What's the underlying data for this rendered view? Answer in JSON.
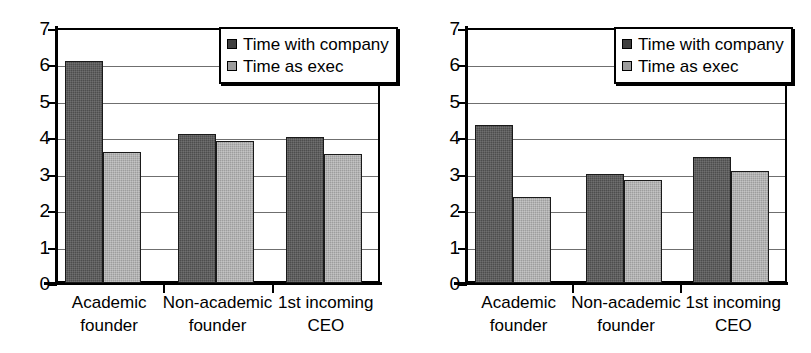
{
  "chart_data": [
    {
      "type": "bar",
      "panel": "left",
      "title": "",
      "xlabel": "",
      "ylabel": "",
      "ylim": [
        0,
        7
      ],
      "yticks": [
        0,
        1,
        2,
        3,
        4,
        5,
        6,
        7
      ],
      "grid": true,
      "legend_position": "top-right",
      "categories": [
        "Academic founder",
        "Non-academic founder",
        "1st incoming CEO"
      ],
      "category_lines": [
        [
          "Academic",
          "founder"
        ],
        [
          "Non-academic",
          "founder"
        ],
        [
          "1st incoming",
          "CEO"
        ]
      ],
      "series": [
        {
          "name": "Time with company",
          "color": "#4d4d4d",
          "values": [
            6.1,
            4.1,
            4.0
          ]
        },
        {
          "name": "Time as exec",
          "color": "#9d9d9d",
          "values": [
            3.6,
            3.9,
            3.55
          ]
        }
      ]
    },
    {
      "type": "bar",
      "panel": "right",
      "title": "",
      "xlabel": "",
      "ylabel": "",
      "ylim": [
        0,
        7
      ],
      "yticks": [
        0,
        1,
        2,
        3,
        4,
        5,
        6,
        7
      ],
      "grid": true,
      "legend_position": "top-right",
      "categories": [
        "Academic founder",
        "Non-academic founder",
        "1st incoming CEO"
      ],
      "category_lines": [
        [
          "Academic",
          "founder"
        ],
        [
          "Non-academic",
          "founder"
        ],
        [
          "1st incoming",
          "CEO"
        ]
      ],
      "series": [
        {
          "name": "Time with company",
          "color": "#4d4d4d",
          "values": [
            4.35,
            3.0,
            3.45
          ]
        },
        {
          "name": "Time as exec",
          "color": "#9d9d9d",
          "values": [
            2.35,
            2.82,
            3.08
          ]
        }
      ]
    }
  ]
}
